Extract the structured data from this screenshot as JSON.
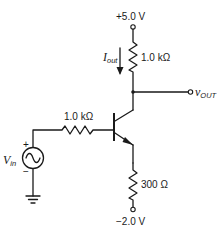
{
  "diagram": {
    "type": "circuit-schematic",
    "supply_positive": {
      "label": "+5.0 V"
    },
    "supply_negative": {
      "label": "−2.0 V"
    },
    "collector_resistor": {
      "label": "1.0 kΩ"
    },
    "base_resistor": {
      "label": "1.0 kΩ"
    },
    "emitter_resistor": {
      "label": "300 Ω"
    },
    "current_label": {
      "main": "I",
      "sub": "out"
    },
    "output_label": {
      "main": "v",
      "sub": "OUT"
    },
    "source_label": {
      "main": "V",
      "sub": "in"
    },
    "source_polarity": {
      "plus": "+",
      "minus": "−"
    }
  }
}
